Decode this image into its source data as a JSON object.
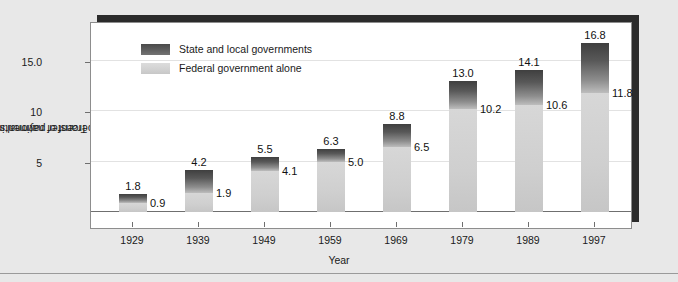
{
  "chart_data": {
    "type": "bar",
    "subtype": "stacked",
    "title": "",
    "xlabel": "Year",
    "ylabel": "Transfer payments as a percent of national income",
    "ylabel_lines": [
      "Transfer payments",
      "as a percent of national income"
    ],
    "categories": [
      "1929",
      "1939",
      "1949",
      "1959",
      "1969",
      "1979",
      "1989",
      "1997"
    ],
    "series": [
      {
        "name": "State and local governments",
        "role": "total",
        "color": "#585858",
        "values": [
          1.8,
          4.2,
          5.5,
          6.3,
          8.8,
          13.0,
          14.1,
          16.8
        ],
        "labels": [
          "1.8",
          "4.2",
          "5.5",
          "6.3",
          "8.8",
          "13.0",
          "14.1",
          "16.8"
        ]
      },
      {
        "name": "Federal government alone",
        "role": "federal",
        "color": "#d2d2d2",
        "values": [
          0.9,
          1.9,
          4.1,
          5.0,
          6.5,
          10.2,
          10.6,
          11.8
        ],
        "labels": [
          "0.9",
          "1.9",
          "4.1",
          "5.0",
          "6.5",
          "10.2",
          "10.6",
          "11.8"
        ]
      }
    ],
    "ylim": [
      0,
      18.2
    ],
    "yticks": [
      5,
      10,
      15
    ],
    "ytick_labels": [
      "5",
      "10",
      "15.0"
    ],
    "grid": true,
    "legend_position": "top-left"
  },
  "legend": {
    "items": [
      {
        "label": "State and local governments",
        "swatch": "dark-gradient-swatch"
      },
      {
        "label": "Federal government alone",
        "swatch": "light-gradient-swatch"
      }
    ]
  },
  "axes": {
    "x_title": "Year",
    "y_title_line1": "Transfer payments",
    "y_title_line2": "as a percent of national income"
  }
}
